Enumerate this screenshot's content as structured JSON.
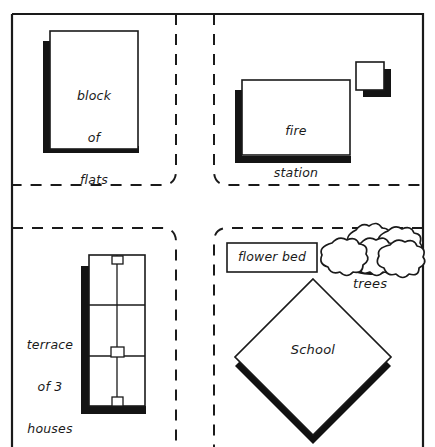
{
  "map": {
    "title": "Neighbourhood street map sketch",
    "background_color": "#ffffff",
    "ink_color": "#1a1a1a",
    "shadow_color": "#111111",
    "frame": {
      "name": "map-border",
      "x": 11,
      "y": 13,
      "width": 412,
      "height": 440,
      "stroke_width": 2.2
    },
    "roads": {
      "style": "dashed",
      "dash_pattern": "11 9",
      "stroke_width": 2.0,
      "corner_radius": 14,
      "vertical": [
        {
          "name": "road-vertical-west-edge",
          "x": 176
        },
        {
          "name": "road-vertical-east-edge",
          "x": 214
        }
      ],
      "horizontal": [
        {
          "name": "road-horizontal-north-edge",
          "y": 185
        },
        {
          "name": "road-horizontal-south-edge",
          "y": 228
        }
      ]
    },
    "buildings": [
      {
        "name": "block-of-flats",
        "shape": "rect",
        "label": "block\nof\nflats",
        "label_lines": [
          "block",
          "of",
          "flats"
        ],
        "x": 50,
        "y": 31,
        "width": 88,
        "height": 118,
        "shadow": "left-bottom"
      },
      {
        "name": "fire-station",
        "shape": "rect",
        "label": "fire\nstation",
        "label_lines": [
          "fire",
          "station"
        ],
        "x": 242,
        "y": 80,
        "width": 108,
        "height": 75,
        "shadow": "left-bottom"
      },
      {
        "name": "fire-station-annex",
        "shape": "rect",
        "label": "",
        "label_lines": [],
        "x": 356,
        "y": 62,
        "width": 28,
        "height": 28,
        "shadow": "right-bottom"
      },
      {
        "name": "terrace-of-3-houses",
        "shape": "rect-terrace",
        "label": "terrace\nof 3\nhouses",
        "label_lines": [
          "terrace",
          "of 3",
          "houses"
        ],
        "x": 89,
        "y": 255,
        "width": 56,
        "height": 151,
        "units": 3,
        "doors": 3,
        "shadow": "left-bottom"
      },
      {
        "name": "flower-bed",
        "shape": "rect",
        "label": "flower bed",
        "label_lines": [
          "flower bed"
        ],
        "x": 227,
        "y": 243,
        "width": 90,
        "height": 29,
        "shadow": "none"
      },
      {
        "name": "school",
        "shape": "diamond",
        "label": "School",
        "label_lines": [
          "School"
        ],
        "center_x": 313,
        "center_y": 357,
        "half_diagonal": 78,
        "shadow": "bottom-left-bottom-right"
      }
    ],
    "features": [
      {
        "name": "trees",
        "shape": "tree-cluster",
        "label": "trees",
        "count": 5,
        "center_x": 369,
        "center_y": 258
      }
    ],
    "labels": [
      {
        "name": "label-block-of-flats",
        "text": "block\nof\nflats"
      },
      {
        "name": "label-fire-station",
        "text": "fire\nstation"
      },
      {
        "name": "label-terrace-of-3-houses",
        "text": "terrace\nof 3\nhouses"
      },
      {
        "name": "label-flower-bed",
        "text": "flower bed"
      },
      {
        "name": "label-school",
        "text": "School"
      },
      {
        "name": "label-trees",
        "text": "trees"
      }
    ]
  }
}
